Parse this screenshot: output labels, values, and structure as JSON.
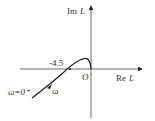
{
  "diagram": {
    "axes": {
      "y_label_prefix": "Im",
      "y_label_var": "L",
      "x_label_prefix": "Re",
      "x_label_var": "L",
      "origin_label": "O"
    },
    "annotations": {
      "crossing_value": "-4.5",
      "start_label": "ω=0⁺",
      "direction_label": "ω"
    },
    "colors": {
      "line": "#222222",
      "text": "#333333"
    }
  }
}
